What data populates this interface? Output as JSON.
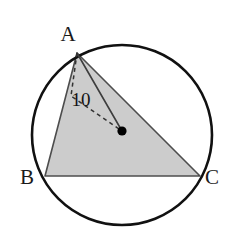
{
  "figure": {
    "canvas": {
      "width": 237,
      "height": 244,
      "background": "#ffffff"
    },
    "colors": {
      "stroke": "#111111",
      "triangle_fill": "#cccccc",
      "triangle_stroke": "#4d4d4d",
      "dashed_stroke": "#333333",
      "center_dot": "#000000",
      "text": "#141414"
    },
    "circle": {
      "name": "circumscribed-circle",
      "cx": 122,
      "cy": 135,
      "r": 90,
      "stroke_width": 2.6
    },
    "center_point": {
      "name": "circle-center",
      "x": 122,
      "y": 131,
      "r": 4.6
    },
    "triangle": {
      "name": "inscribed-triangle-ABC",
      "vertices": [
        {
          "id": "A",
          "x": 77,
          "y": 53
        },
        {
          "id": "B",
          "x": 45,
          "y": 176
        },
        {
          "id": "C",
          "x": 200,
          "y": 176
        }
      ],
      "points_attr": "77,53 45,176 200,176"
    },
    "segments": [
      {
        "name": "segment-A-to-center",
        "style": "solid",
        "x1": 77,
        "y1": 53,
        "x2": 122,
        "y2": 131
      }
    ],
    "dashed_path": {
      "name": "radius-dashed-path",
      "d": "M 77 53 L 71 96 L 122 131",
      "dasharray": "4 3.5",
      "stroke_width": 1.5
    },
    "labels": [
      {
        "name": "vertex-label-A",
        "text": "A",
        "x": 68,
        "y": 34
      },
      {
        "name": "vertex-label-B",
        "text": "B",
        "x": 27,
        "y": 177
      },
      {
        "name": "vertex-label-C",
        "text": "C",
        "x": 212,
        "y": 177
      },
      {
        "name": "radius-length-label",
        "text": "10",
        "x": 81,
        "y": 99
      }
    ]
  }
}
